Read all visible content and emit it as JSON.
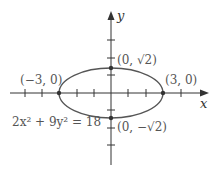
{
  "diagram": {
    "type": "ellipse-graph",
    "equation": "2x² + 9y² = 18",
    "axes": {
      "x_label": "x",
      "y_label": "y"
    },
    "points": [
      {
        "label": "(0, √2)",
        "x": 0,
        "y": 1.414
      },
      {
        "label": "(0, −√2)",
        "x": 0,
        "y": -1.414
      },
      {
        "label": "(−3, 0)",
        "x": -3,
        "y": 0
      },
      {
        "label": "(3, 0)",
        "x": 3,
        "y": 0
      }
    ],
    "semi_major_axis": 3,
    "semi_minor_axis": 1.414,
    "x_ticks": [
      -5,
      -4,
      -3,
      -2,
      -1,
      1,
      2,
      3,
      4
    ],
    "y_ticks": [
      -3,
      -2,
      -1,
      1,
      2,
      3
    ],
    "colors": {
      "curve": "#555555",
      "axis": "#333333",
      "text": "#555555"
    }
  }
}
